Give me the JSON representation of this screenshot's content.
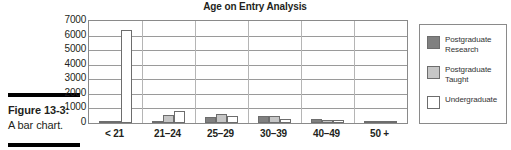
{
  "caption": {
    "figure_number": "Figure 13-3:",
    "description": "A bar chart."
  },
  "legend": {
    "position": "right",
    "entries": [
      {
        "label": "Postgraduate Research",
        "color": "#808080",
        "swatch_name": "legend-swatch-postgraduate-research"
      },
      {
        "label": "Postgraduate Taught",
        "color": "#c6c6c6",
        "swatch_name": "legend-swatch-postgraduate-taught"
      },
      {
        "label": "Undergraduate",
        "color": "#ffffff",
        "swatch_name": "legend-swatch-undergraduate"
      }
    ]
  },
  "chart_data": {
    "type": "bar",
    "title": "Age on Entry Analysis",
    "xlabel": "",
    "ylabel": "",
    "ylim": [
      0,
      7000
    ],
    "ytick_step": 1000,
    "yticks": [
      "7000",
      "6000",
      "5000",
      "4000",
      "3000",
      "2000",
      "1000",
      "0"
    ],
    "grid": true,
    "categories": [
      "< 21",
      "21–24",
      "25–29",
      "30–39",
      "40–49",
      "50 +"
    ],
    "series": [
      {
        "name": "Postgraduate Research",
        "color": "#808080",
        "values": [
          120,
          150,
          430,
          480,
          250,
          110
        ]
      },
      {
        "name": "Postgraduate Taught",
        "color": "#c6c6c6",
        "values": [
          60,
          540,
          650,
          470,
          230,
          90
        ]
      },
      {
        "name": "Undergraduate",
        "color": "#ffffff",
        "values": [
          6350,
          810,
          450,
          260,
          220,
          70
        ]
      }
    ]
  }
}
